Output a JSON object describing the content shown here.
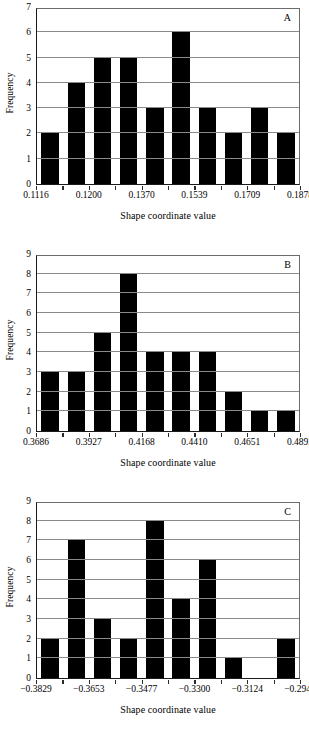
{
  "figure": {
    "panel_count": 3
  },
  "chart_data": [
    {
      "type": "bar",
      "panel_label": "A",
      "title": "",
      "xlabel": "Shape coordinate value",
      "ylabel": "Frequency",
      "ylim": [
        0,
        7
      ],
      "yticks": [
        0,
        1,
        2,
        3,
        4,
        5,
        6,
        7
      ],
      "grid": true,
      "legend": "none",
      "x_tick_labels": [
        "0.1116",
        "0.1200",
        "0.1370",
        "0.1539",
        "0.1709",
        "0.1878"
      ],
      "x_tick_positions": [
        0,
        2,
        4,
        6,
        8,
        10
      ],
      "bin_count": 10,
      "categories": [
        "0.1116",
        "0.1200",
        "0.1285",
        "0.1370",
        "0.1454",
        "0.1539",
        "0.1624",
        "0.1709",
        "0.1793",
        "0.1878"
      ],
      "values": [
        2,
        4,
        5,
        5,
        3,
        6,
        3,
        2,
        3,
        2
      ]
    },
    {
      "type": "bar",
      "panel_label": "B",
      "title": "",
      "xlabel": "Shape coordinate value",
      "ylabel": "Frequency",
      "ylim": [
        0,
        9
      ],
      "yticks": [
        0,
        1,
        2,
        3,
        4,
        5,
        6,
        7,
        8,
        9
      ],
      "grid": true,
      "legend": "none",
      "x_tick_labels": [
        "0.3686",
        "0.3927",
        "0.4168",
        "0.4410",
        "0.4651",
        "0.4893"
      ],
      "x_tick_positions": [
        0,
        2,
        4,
        6,
        8,
        10
      ],
      "bin_count": 10,
      "categories": [
        "0.3686",
        "0.3927",
        "0.4047",
        "0.4168",
        "0.4289",
        "0.4410",
        "0.4530",
        "0.4651",
        "0.4772",
        "0.4893"
      ],
      "values": [
        3,
        3,
        5,
        8,
        4,
        4,
        4,
        2,
        1,
        1
      ]
    },
    {
      "type": "bar",
      "panel_label": "C",
      "title": "",
      "xlabel": "Shape coordinate value",
      "ylabel": "Frequency",
      "ylim": [
        0,
        9
      ],
      "yticks": [
        0,
        1,
        2,
        3,
        4,
        5,
        6,
        7,
        8,
        9
      ],
      "grid": true,
      "legend": "none",
      "x_tick_labels": [
        "−0.3829",
        "−0.3653",
        "−0.3477",
        "−0.3300",
        "−0.3124",
        "−0.2948"
      ],
      "x_tick_positions": [
        0,
        2,
        4,
        6,
        8,
        10
      ],
      "bin_count": 10,
      "categories": [
        "−0.3829",
        "−0.3653",
        "−0.3565",
        "−0.3477",
        "−0.3389",
        "−0.3300",
        "−0.3212",
        "−0.3124",
        "−0.3036",
        "−0.2948"
      ],
      "values": [
        2,
        7,
        3,
        2,
        8,
        4,
        6,
        1,
        0,
        2
      ]
    }
  ],
  "colors": {
    "bar_fill": "#000000",
    "axis": "#1a1a1a",
    "gridline": "#8a8a8a",
    "background": "#ffffff",
    "text": "#000000"
  }
}
